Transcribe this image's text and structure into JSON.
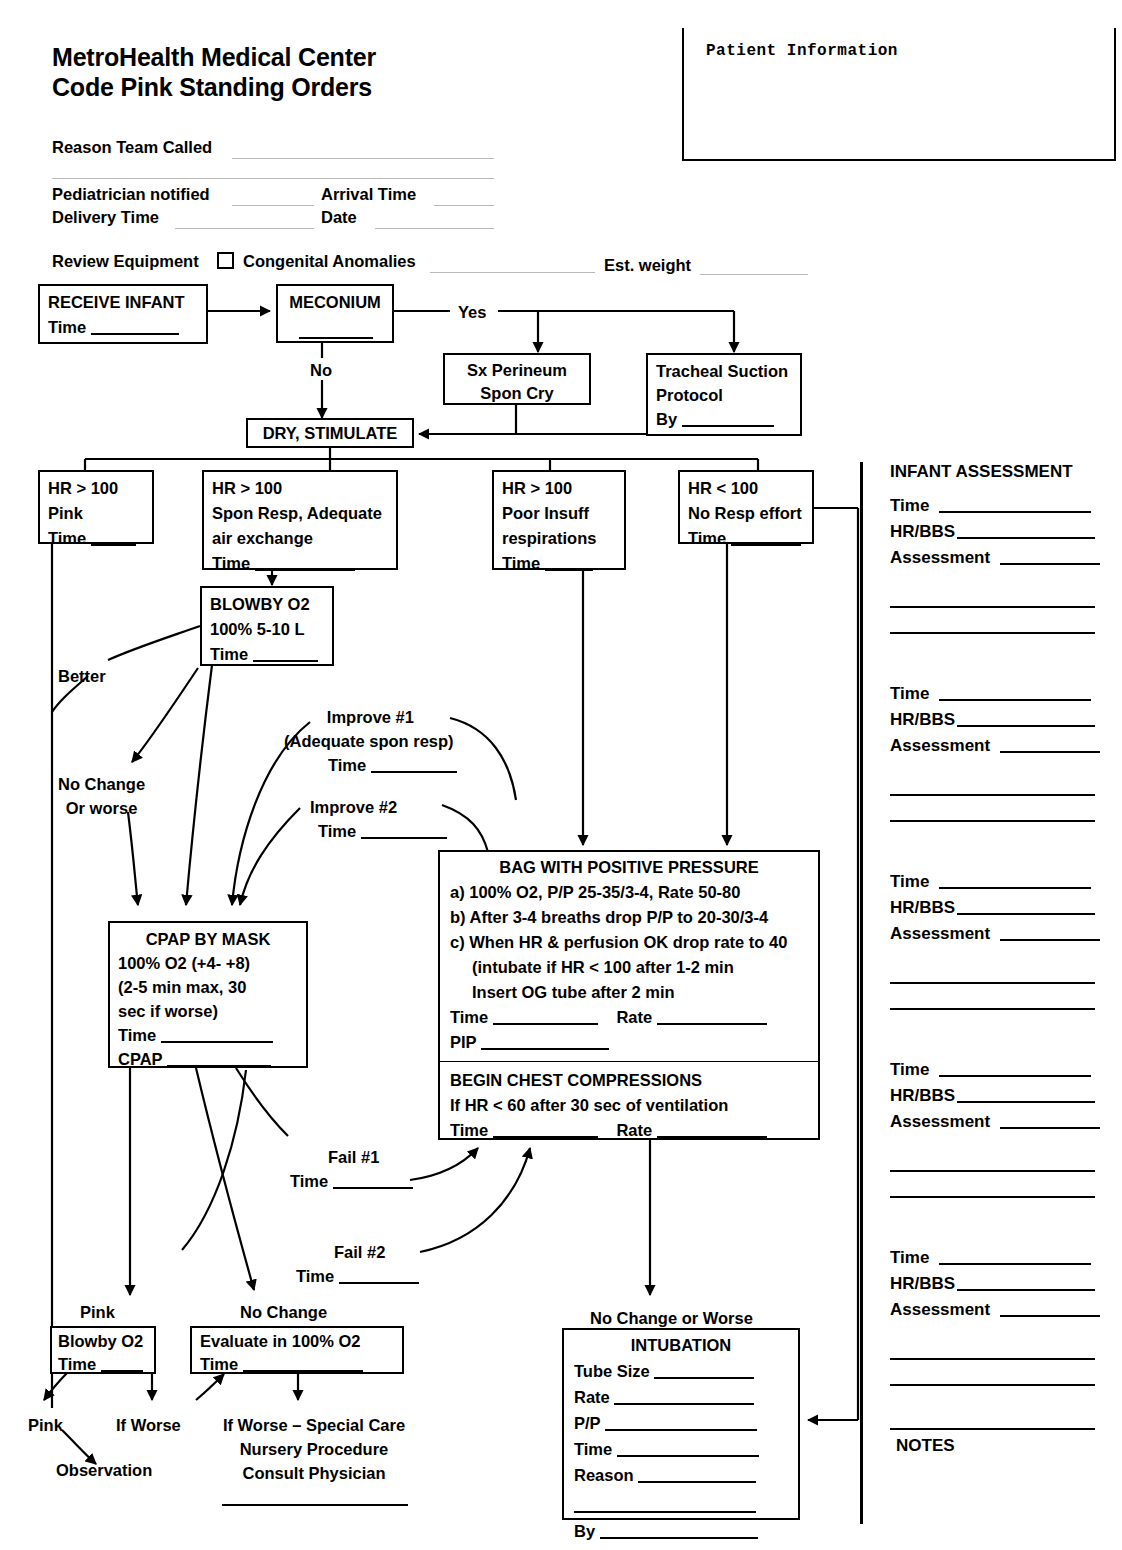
{
  "document": {
    "title_line1": "MetroHealth Medical Center",
    "title_line2": "Code Pink Standing Orders"
  },
  "patient_box": {
    "label": "Patient Information"
  },
  "form_fields": {
    "reason_team_called": "Reason Team Called",
    "pediatrician_notified": "Pediatrician notified",
    "arrival_time": "Arrival Time",
    "delivery_time": "Delivery Time",
    "date": "Date",
    "review_equipment": "Review Equipment",
    "congenital_anomalies": "Congenital Anomalies",
    "est_weight": "Est. weight"
  },
  "flow": {
    "receive_infant": {
      "title": "RECEIVE INFANT",
      "line2": "Time"
    },
    "meconium": {
      "title": "MECONIUM"
    },
    "yes_label": "Yes",
    "no_label": "No",
    "sx_perineum": {
      "line1": "Sx Perineum",
      "line2": "Spon Cry"
    },
    "tracheal_suction": {
      "line1": "Tracheal Suction",
      "line2": "Protocol",
      "line3": "By"
    },
    "dry_stimulate": {
      "title": "DRY, STIMULATE"
    },
    "hr_pink": {
      "line1": "HR > 100",
      "line2": "Pink",
      "line3": "Time"
    },
    "hr_spon_resp": {
      "line1": "HR > 100",
      "line2": "Spon Resp, Adequate",
      "line3": "air exchange",
      "line4": "Time"
    },
    "hr_poor": {
      "line1": "HR > 100",
      "line2": "Poor Insuff",
      "line3": "respirations",
      "line4": "Time"
    },
    "hr_no_resp": {
      "line1": "HR < 100",
      "line2": "No Resp effort",
      "line3": "Time"
    },
    "blowby_o2": {
      "title": "BLOWBY O2",
      "line2": "100% 5-10 L",
      "line3": "Time"
    },
    "better_label": "Better",
    "no_change_or_worse_label_line1": "No Change",
    "no_change_or_worse_label_line2": "Or worse",
    "improve1_line1": "Improve #1",
    "improve1_line2": "(Adequate spon resp)",
    "improve1_time": "Time",
    "improve2_line1": "Improve #2",
    "improve2_time": "Time",
    "cpap": {
      "title": "CPAP BY MASK",
      "line2": "100% O2 (+4- +8)",
      "line3": "(2-5 min max, 30",
      "line4": " sec if worse)",
      "line5": "Time",
      "line6": "CPAP"
    },
    "bag": {
      "title": "BAG WITH POSITIVE PRESSURE",
      "a": "a) 100% O2, P/P 25-35/3-4, Rate 50-80",
      "b": "b) After 3-4 breaths drop P/P to 20-30/3-4",
      "c": "c) When HR & perfusion OK drop rate to 40",
      "c2": "(intubate if HR < 100 after 1-2 min",
      "c3": "Insert OG tube after 2 min",
      "time": "Time",
      "rate": "Rate",
      "pip": "PIP"
    },
    "compressions": {
      "title": "BEGIN CHEST COMPRESSIONS",
      "line2": "If HR < 60 after 30 sec of ventilation",
      "time": "Time",
      "rate": "Rate"
    },
    "fail1_label": "Fail #1",
    "fail1_time": "Time",
    "fail2_label": "Fail #2",
    "fail2_time": "Time",
    "pink_label": "Pink",
    "no_change_label": "No Change",
    "blowby_small": {
      "line1": "Blowby O2",
      "line2": "Time"
    },
    "evaluate": {
      "line1": "Evaluate in 100% O2",
      "line2": "Time"
    },
    "pink_bottom_label": "Pink",
    "if_worse_label": "If Worse",
    "observation_label": "Observation",
    "special_care_line1": "If Worse – Special Care",
    "special_care_line2": "Nursery Procedure",
    "special_care_line3": "Consult Physician",
    "no_change_or_worse_bottom": "No Change or Worse",
    "intubation": {
      "title": "INTUBATION",
      "tube_size": "Tube Size",
      "rate": "Rate",
      "pp": "P/P",
      "time": "Time",
      "reason": "Reason",
      "by": "By"
    }
  },
  "sidebar": {
    "header": "INFANT ASSESSMENT",
    "row_time": "Time",
    "row_hrbbs": "HR/BBS",
    "row_assessment": "Assessment",
    "notes": "NOTES",
    "blocks": 5
  },
  "colors": {
    "ink": "#000000",
    "paper": "#ffffff",
    "faint_rule": "#b9b9b9"
  }
}
